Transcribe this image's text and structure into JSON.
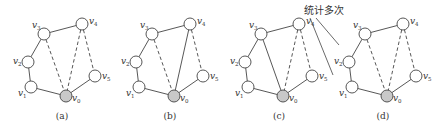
{
  "figure": {
    "panels": [
      {
        "id": "a",
        "caption": "(a)",
        "offset_x": 0,
        "solid_edges": [
          [
            "v3",
            "v4"
          ],
          [
            "v3",
            "v2"
          ],
          [
            "v2",
            "v1"
          ],
          [
            "v1",
            "v0"
          ],
          [
            "v0",
            "v5"
          ]
        ],
        "dashed_edges": [
          [
            "v3",
            "v0"
          ],
          [
            "v4",
            "v0"
          ],
          [
            "v4",
            "v5"
          ]
        ]
      },
      {
        "id": "b",
        "caption": "(b)",
        "offset_x": 108,
        "solid_edges": [
          [
            "v3",
            "v4"
          ],
          [
            "v3",
            "v2"
          ],
          [
            "v2",
            "v1"
          ],
          [
            "v1",
            "v0"
          ],
          [
            "v0",
            "v5"
          ],
          [
            "v4",
            "v0"
          ]
        ],
        "dashed_edges": [
          [
            "v3",
            "v0"
          ],
          [
            "v4",
            "v5"
          ]
        ]
      },
      {
        "id": "c",
        "caption": "(c)",
        "offset_x": 217,
        "solid_edges": [
          [
            "v3",
            "v4"
          ],
          [
            "v3",
            "v2"
          ],
          [
            "v2",
            "v1"
          ],
          [
            "v1",
            "v0"
          ],
          [
            "v0",
            "v5"
          ],
          [
            "v3",
            "v0"
          ]
        ],
        "dashed_edges": [
          [
            "v4",
            "v0"
          ],
          [
            "v4",
            "v5"
          ]
        ]
      },
      {
        "id": "d",
        "caption": "(d)",
        "offset_x": 321,
        "solid_edges": [
          [
            "v3",
            "v4"
          ],
          [
            "v3",
            "v2"
          ],
          [
            "v2",
            "v1"
          ],
          [
            "v1",
            "v0"
          ],
          [
            "v0",
            "v5"
          ]
        ],
        "dashed_edges": [
          [
            "v3",
            "v0"
          ],
          [
            "v4",
            "v0"
          ],
          [
            "v4",
            "v5"
          ]
        ]
      }
    ],
    "nodes": {
      "v0": {
        "x": 66,
        "y": 96,
        "label": "v",
        "sub": "0",
        "filled": true,
        "lx": 6,
        "ly": 5
      },
      "v1": {
        "x": 31,
        "y": 87,
        "label": "v",
        "sub": "1",
        "filled": false,
        "lx": -13,
        "ly": 9
      },
      "v2": {
        "x": 28,
        "y": 62,
        "label": "v",
        "sub": "2",
        "filled": false,
        "lx": -15,
        "ly": 2
      },
      "v3": {
        "x": 44,
        "y": 34,
        "label": "v",
        "sub": "3",
        "filled": false,
        "lx": -12,
        "ly": -6
      },
      "v4": {
        "x": 82,
        "y": 24,
        "label": "v",
        "sub": "4",
        "filled": false,
        "lx": 7,
        "ly": 0
      },
      "v5": {
        "x": 95,
        "y": 76,
        "label": "v",
        "sub": "5",
        "filled": false,
        "lx": 7,
        "ly": 3
      }
    },
    "annotation": {
      "text": "统计多次",
      "x": 304,
      "y": 14,
      "pointers": [
        [
          316,
          18,
          339,
          45
        ],
        [
          310,
          18,
          333,
          75
        ]
      ]
    },
    "colors": {
      "edge": "#444444",
      "node_fill": "#ffffff",
      "node_filled": "#c8c8c8",
      "text": "#333333"
    }
  }
}
